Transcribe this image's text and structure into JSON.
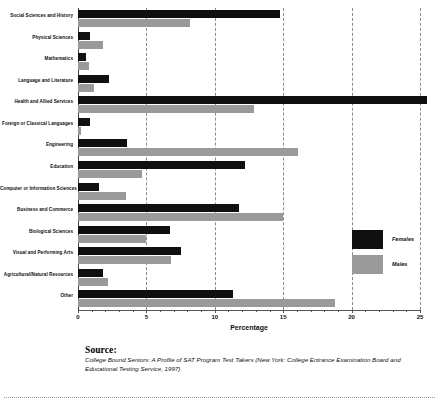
{
  "chart_data": {
    "type": "bar",
    "orientation": "horizontal",
    "title": "",
    "xlabel": "Percentage",
    "ylabel": "",
    "xlim": [
      0,
      25
    ],
    "xticks": [
      0,
      5,
      10,
      15,
      20,
      25
    ],
    "grid": true,
    "legend_position": "right-inside",
    "categories": [
      "Social Sciences and History",
      "Physical Sciences",
      "Mathematics",
      "Language and Literature",
      "Health and Allied Services",
      "Foreign or Classical Languages",
      "Engineering",
      "Education",
      "Computer or Information Sciences",
      "Business and Commerce",
      "Biological Sciences",
      "Visual and Performing Arts",
      "Agricultural/Natural Resources",
      "Other"
    ],
    "series": [
      {
        "name": "Females",
        "color": "#101010",
        "values": [
          14.8,
          0.9,
          0.6,
          2.3,
          25.5,
          0.9,
          3.6,
          12.2,
          1.5,
          11.8,
          6.7,
          7.5,
          1.8,
          11.3
        ]
      },
      {
        "name": "Males",
        "color": "#9a9a9a",
        "values": [
          8.2,
          1.8,
          0.8,
          1.2,
          12.9,
          0.2,
          16.1,
          4.7,
          3.5,
          15.0,
          5.0,
          6.8,
          2.2,
          18.8
        ]
      }
    ]
  },
  "legend": {
    "items": [
      {
        "label": "Females",
        "color": "#101010"
      },
      {
        "label": "Males",
        "color": "#9a9a9a"
      }
    ]
  },
  "source": {
    "heading": "Source:",
    "text": "College Bound Seniors: A Profile of SAT Program Test Takers (New York: College Entrance Examination Board and Educational Testing Service, 1997)"
  }
}
